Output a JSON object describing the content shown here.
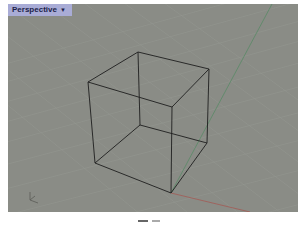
{
  "viewport": {
    "title": "Perspective",
    "dropdown_icon": "caret-down-icon",
    "background_color": "#8a8c86",
    "grid_color": "#9a9c95",
    "axes": {
      "x_color": "#a0605a",
      "y_color": "#5f8a6a"
    },
    "object": {
      "type": "wireframe-cube",
      "edge_color": "#1e1e1e"
    },
    "axis_widget_icon": "world-axes-icon"
  }
}
